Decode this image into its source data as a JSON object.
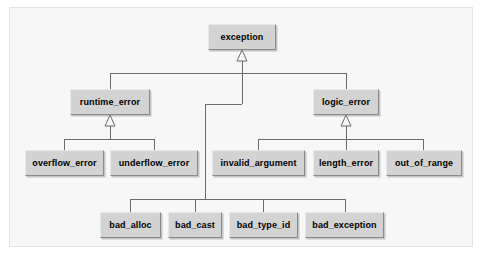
{
  "diagram": {
    "type": "uml-class-inheritance",
    "style": {
      "page_background": "#ffffff",
      "frame_background": "#f7f7f7",
      "frame_border": "#e3e3e3",
      "node_fill": "#d3d3d3",
      "node_border": "#8a8a8a",
      "edge_color": "#6b6b6b",
      "text_color": "#000000"
    },
    "nodes": [
      {
        "id": "exception",
        "label": "exception",
        "x": 208,
        "y": 24,
        "w": 68,
        "h": 26
      },
      {
        "id": "runtime_error",
        "label": "runtime_error",
        "x": 70,
        "y": 89,
        "w": 80,
        "h": 26
      },
      {
        "id": "logic_error",
        "label": "logic_error",
        "x": 313,
        "y": 89,
        "w": 66,
        "h": 26
      },
      {
        "id": "overflow_error",
        "label": "overflow_error",
        "x": 25,
        "y": 150,
        "w": 79,
        "h": 26
      },
      {
        "id": "underflow_error",
        "label": "underflow_error",
        "x": 110,
        "y": 150,
        "w": 88,
        "h": 26
      },
      {
        "id": "invalid_argument",
        "label": "invalid_argument",
        "x": 212,
        "y": 150,
        "w": 93,
        "h": 26
      },
      {
        "id": "length_error",
        "label": "length_error",
        "x": 313,
        "y": 150,
        "w": 66,
        "h": 26
      },
      {
        "id": "out_of_range",
        "label": "out_of_range",
        "x": 386,
        "y": 150,
        "w": 76,
        "h": 26
      },
      {
        "id": "bad_alloc",
        "label": "bad_alloc",
        "x": 100,
        "y": 212,
        "w": 61,
        "h": 26
      },
      {
        "id": "bad_cast",
        "label": "bad_cast",
        "x": 168,
        "y": 212,
        "w": 54,
        "h": 26
      },
      {
        "id": "bad_type_id",
        "label": "bad_type_id",
        "x": 229,
        "y": 212,
        "w": 69,
        "h": 26
      },
      {
        "id": "bad_exception",
        "label": "bad_exception",
        "x": 305,
        "y": 212,
        "w": 79,
        "h": 26
      }
    ],
    "edges": [
      {
        "from": "runtime_error",
        "to": "exception",
        "relation": "generalization"
      },
      {
        "from": "logic_error",
        "to": "exception",
        "relation": "generalization"
      },
      {
        "from": "bad_alloc",
        "to": "exception",
        "relation": "generalization"
      },
      {
        "from": "bad_cast",
        "to": "exception",
        "relation": "generalization"
      },
      {
        "from": "bad_type_id",
        "to": "exception",
        "relation": "generalization"
      },
      {
        "from": "bad_exception",
        "to": "exception",
        "relation": "generalization"
      },
      {
        "from": "overflow_error",
        "to": "runtime_error",
        "relation": "generalization"
      },
      {
        "from": "underflow_error",
        "to": "runtime_error",
        "relation": "generalization"
      },
      {
        "from": "invalid_argument",
        "to": "logic_error",
        "relation": "generalization"
      },
      {
        "from": "length_error",
        "to": "logic_error",
        "relation": "generalization"
      },
      {
        "from": "out_of_range",
        "to": "logic_error",
        "relation": "generalization"
      }
    ]
  }
}
